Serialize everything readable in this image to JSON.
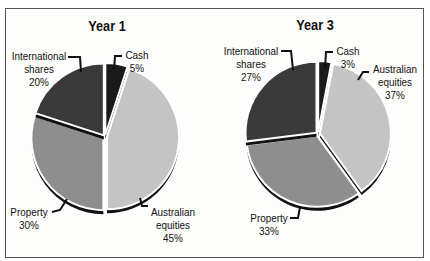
{
  "chart_data": [
    {
      "type": "pie",
      "title": "Year 1",
      "categories": [
        "Cash",
        "Australian equities",
        "Property",
        "International shares"
      ],
      "values": [
        5,
        45,
        30,
        20
      ],
      "labels": [
        "Cash\n5%",
        "Australian\nequities\n45%",
        "Property\n30%",
        "International\nshares\n20%"
      ]
    },
    {
      "type": "pie",
      "title": "Year 3",
      "categories": [
        "Cash",
        "Australian equities",
        "Property",
        "International shares"
      ],
      "values": [
        3,
        37,
        33,
        27
      ],
      "labels": [
        "Cash\n3%",
        "Australian\nequities\n37%",
        "Property\n33%",
        "International\nshares\n27%"
      ]
    }
  ],
  "colors": {
    "cash": "#1a1a1a",
    "australian_equities": "#c4c4c4",
    "property": "#8e8e8e",
    "international_shares": "#3a3a3a"
  },
  "year1": {
    "title": "Year 1",
    "cash": {
      "name": "Cash",
      "pct": "5%"
    },
    "aus": {
      "name1": "Australian",
      "name2": "equities",
      "pct": "45%"
    },
    "property": {
      "name": "Property",
      "pct": "30%"
    },
    "intl": {
      "name1": "International",
      "name2": "shares",
      "pct": "20%"
    }
  },
  "year3": {
    "title": "Year 3",
    "cash": {
      "name": "Cash",
      "pct": "3%"
    },
    "aus": {
      "name1": "Australian",
      "name2": "equities",
      "pct": "37%"
    },
    "property": {
      "name": "Property",
      "pct": "33%"
    },
    "intl": {
      "name1": "International",
      "name2": "shares",
      "pct": "27%"
    }
  }
}
